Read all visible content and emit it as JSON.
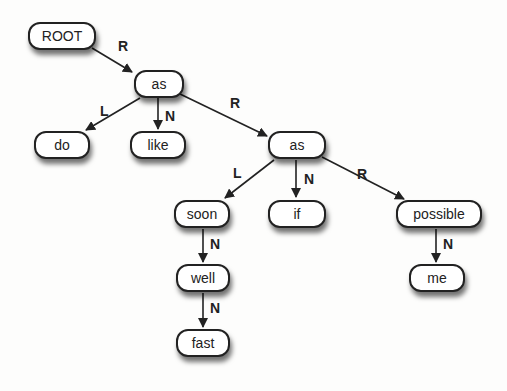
{
  "diagram": {
    "type": "tree",
    "nodes": [
      {
        "id": "root",
        "label": "ROOT",
        "x": 28,
        "y": 22,
        "w": 68
      },
      {
        "id": "as1",
        "label": "as",
        "x": 134,
        "y": 70,
        "w": 50
      },
      {
        "id": "do",
        "label": "do",
        "x": 34,
        "y": 131,
        "w": 56
      },
      {
        "id": "like",
        "label": "like",
        "x": 130,
        "y": 131,
        "w": 56
      },
      {
        "id": "as2",
        "label": "as",
        "x": 268,
        "y": 131,
        "w": 58
      },
      {
        "id": "soon",
        "label": "soon",
        "x": 174,
        "y": 200,
        "w": 56
      },
      {
        "id": "if",
        "label": "if",
        "x": 268,
        "y": 200,
        "w": 58
      },
      {
        "id": "possible",
        "label": "possible",
        "x": 396,
        "y": 200,
        "w": 86
      },
      {
        "id": "well",
        "label": "well",
        "x": 176,
        "y": 264,
        "w": 54
      },
      {
        "id": "me",
        "label": "me",
        "x": 409,
        "y": 264,
        "w": 56
      },
      {
        "id": "fast",
        "label": "fast",
        "x": 176,
        "y": 329,
        "w": 54
      }
    ],
    "edges": [
      {
        "from": "root",
        "to": "as1",
        "label": "R",
        "x1": 92,
        "y1": 48,
        "x2": 132,
        "y2": 72,
        "lx": 118,
        "ly": 38
      },
      {
        "from": "as1",
        "to": "do",
        "label": "L",
        "x1": 140,
        "y1": 98,
        "x2": 86,
        "y2": 130,
        "lx": 100,
        "ly": 103
      },
      {
        "from": "as1",
        "to": "like",
        "label": "N",
        "x1": 158,
        "y1": 98,
        "x2": 158,
        "y2": 129,
        "lx": 165,
        "ly": 108
      },
      {
        "from": "as1",
        "to": "as2",
        "label": "R",
        "x1": 180,
        "y1": 94,
        "x2": 267,
        "y2": 136,
        "lx": 230,
        "ly": 95
      },
      {
        "from": "as2",
        "to": "soon",
        "label": "L",
        "x1": 274,
        "y1": 160,
        "x2": 225,
        "y2": 198,
        "lx": 233,
        "ly": 165
      },
      {
        "from": "as2",
        "to": "if",
        "label": "N",
        "x1": 296,
        "y1": 160,
        "x2": 296,
        "y2": 197,
        "lx": 304,
        "ly": 171
      },
      {
        "from": "as2",
        "to": "possible",
        "label": "R",
        "x1": 322,
        "y1": 157,
        "x2": 404,
        "y2": 199,
        "lx": 357,
        "ly": 166
      },
      {
        "from": "soon",
        "to": "well",
        "label": "N",
        "x1": 203,
        "y1": 229,
        "x2": 203,
        "y2": 262,
        "lx": 210,
        "ly": 236
      },
      {
        "from": "possible",
        "to": "me",
        "label": "N",
        "x1": 436,
        "y1": 229,
        "x2": 436,
        "y2": 262,
        "lx": 443,
        "ly": 236
      },
      {
        "from": "well",
        "to": "fast",
        "label": "N",
        "x1": 203,
        "y1": 293,
        "x2": 203,
        "y2": 327,
        "lx": 210,
        "ly": 300
      }
    ]
  }
}
